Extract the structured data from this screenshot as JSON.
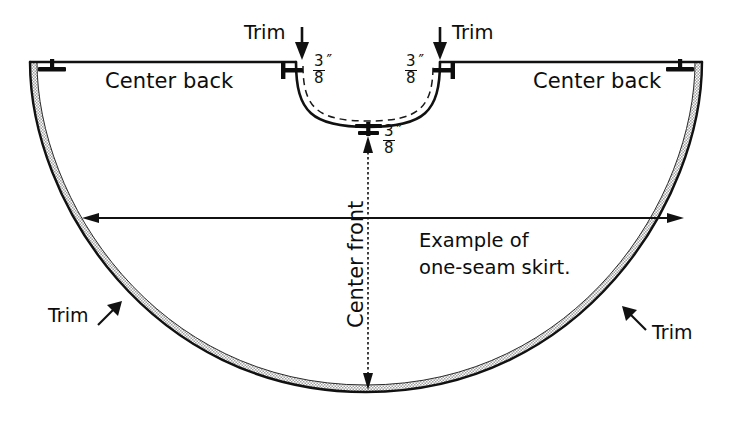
{
  "diagram": {
    "ink_color": "#0d0d0d",
    "background_color": "#ffffff",
    "hem_band_fill": "#b9b9b9",
    "labels": {
      "center_back_left": "Center back",
      "center_back_right": "Center back",
      "center_front": "Center front",
      "trim_top_left": "Trim",
      "trim_top_right": "Trim",
      "trim_bottom_left": "Trim",
      "trim_bottom_right": "Trim",
      "example_line1": "Example of",
      "example_line2": "one-seam skirt."
    },
    "measurements": {
      "waist_left": {
        "numerator": "3",
        "denominator": "8",
        "unit": "″"
      },
      "waist_right": {
        "numerator": "3",
        "denominator": "8",
        "unit": "″"
      },
      "center_front_seam": {
        "numerator": "3",
        "denominator": "8",
        "unit": "″"
      }
    },
    "icons": {
      "grain_marker_left": "tee-notch-icon",
      "grain_marker_right": "tee-notch-icon",
      "waist_marker_left": "tee-notch-icon",
      "waist_marker_right": "tee-notch-icon",
      "center_seam_marker": "tee-notch-icon",
      "trim_arrow_top_left": "arrow-down-icon",
      "trim_arrow_top_right": "arrow-down-icon",
      "trim_arrow_bottom_left": "arrow-up-right-icon",
      "trim_arrow_bottom_right": "arrow-up-left-icon",
      "width_arrow": "double-headed-horizontal-arrow-icon",
      "length_arrow": "double-headed-vertical-arrow-icon"
    }
  }
}
